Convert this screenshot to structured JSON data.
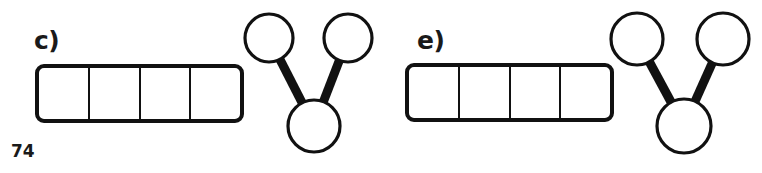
{
  "figure": {
    "page_number": "74",
    "background_color": "#ffffff",
    "stroke_color": "#111111",
    "fill_color": "#ffffff",
    "groups": [
      {
        "id": "c",
        "label": "c)",
        "bar": {
          "name": "segmented-bar",
          "cells": 4,
          "cell_labels": [
            "",
            "",
            "",
            ""
          ],
          "filled": false
        },
        "tree": {
          "name": "y-shaped-tree-graph",
          "node_count": 3,
          "edge_count": 2,
          "nodes": [
            {
              "id": "left-top",
              "cx": 269,
              "cy": 38,
              "r": 24
            },
            {
              "id": "right-top",
              "cx": 348,
              "cy": 38,
              "r": 24
            },
            {
              "id": "bottom",
              "cx": 314,
              "cy": 126,
              "r": 26
            }
          ],
          "edges": [
            {
              "from": "left-top",
              "to": "bottom"
            },
            {
              "from": "right-top",
              "to": "bottom"
            }
          ]
        }
      },
      {
        "id": "e",
        "label": "e)",
        "bar": {
          "name": "segmented-bar",
          "cells": 4,
          "cell_labels": [
            "",
            "",
            "",
            ""
          ],
          "filled": false
        },
        "tree": {
          "name": "y-shaped-tree-graph",
          "node_count": 3,
          "edge_count": 2,
          "nodes": [
            {
              "id": "left-top",
              "cx": 256,
              "cy": 39,
              "r": 26
            },
            {
              "id": "right-top",
              "cx": 342,
              "cy": 39,
              "r": 26
            },
            {
              "id": "bottom",
              "cx": 303,
              "cy": 126,
              "r": 27
            }
          ],
          "edges": [
            {
              "from": "left-top",
              "to": "bottom"
            },
            {
              "from": "right-top",
              "to": "bottom"
            }
          ]
        }
      }
    ]
  }
}
